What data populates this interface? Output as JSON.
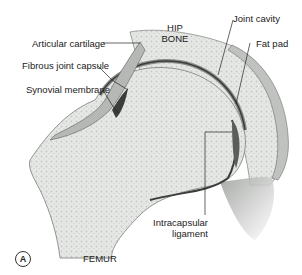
{
  "figure": {
    "panel_label": "A",
    "structures": {
      "hip_bone": "HIP BONE",
      "hip_bone_line1": "HIP",
      "hip_bone_line2": "BONE",
      "femur": "FEMUR"
    },
    "labels": {
      "articular_cartilage": "Articular cartilage",
      "fibrous_joint_capsule": "Fibrous joint capsule",
      "synovial_membrane": "Synovial membrane",
      "joint_cavity": "Joint cavity",
      "fat_pad": "Fat pad",
      "intracapsular_ligament_line1": "Intracapsular",
      "intracapsular_ligament_line2": "ligament"
    },
    "colors": {
      "bone_fill": "#e4e6e4",
      "bone_texture": "#c9ccc9",
      "cartilage": "#8a8e8a",
      "capsule": "#6a6e6a",
      "cavity": "#3a3d3a",
      "leader_line": "#222222"
    }
  }
}
